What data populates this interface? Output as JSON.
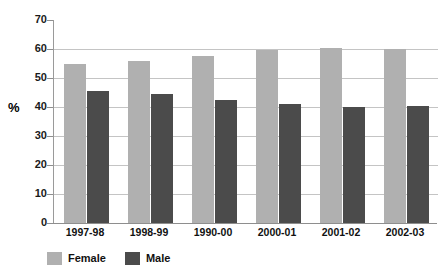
{
  "chart_data": {
    "type": "bar",
    "title": "",
    "xlabel": "",
    "ylabel": "%",
    "ylim": [
      0,
      70
    ],
    "yticks": [
      0,
      10,
      20,
      30,
      40,
      50,
      60,
      70
    ],
    "grid": true,
    "legend_position": "bottom-left",
    "categories": [
      "1997-98",
      "1998-99",
      "1990-00",
      "2000-01",
      "2001-02",
      "2002-03"
    ],
    "series": [
      {
        "name": "Female",
        "color": "#b0b0b0",
        "values": [
          55,
          56,
          57.5,
          59.5,
          60.5,
          60
        ]
      },
      {
        "name": "Male",
        "color": "#4b4b4b",
        "values": [
          45.5,
          44.5,
          42.5,
          41,
          40,
          40.5
        ]
      }
    ]
  },
  "axis": {
    "y_title": "%",
    "tick_labels": [
      "70",
      "60",
      "50",
      "40",
      "30",
      "20",
      "10",
      "0"
    ]
  },
  "legend": {
    "items": [
      {
        "label": "Female",
        "color": "#b0b0b0"
      },
      {
        "label": "Male",
        "color": "#4b4b4b"
      }
    ]
  },
  "artifacts": {
    "top_sliver_left": "",
    "top_sliver_right": ""
  }
}
